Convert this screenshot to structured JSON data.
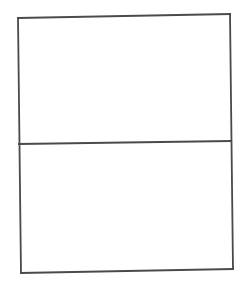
{
  "diagram": {
    "type": "two-panel-box",
    "panels": [
      {
        "name": "top-panel",
        "label": ""
      },
      {
        "name": "bottom-panel",
        "label": ""
      }
    ],
    "colors": {
      "stroke": "#4a4a4a",
      "fill": "#ffffff",
      "background": "#ffffff"
    }
  }
}
